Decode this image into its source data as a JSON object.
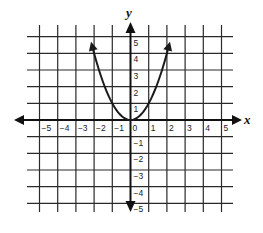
{
  "chart_data": {
    "type": "line",
    "title": "",
    "xlabel": "x",
    "ylabel": "y",
    "xlim": [
      -5,
      5
    ],
    "ylim": [
      -5,
      5
    ],
    "grid": true,
    "x_ticks": [
      -5,
      -4,
      -3,
      -2,
      -1,
      0,
      1,
      2,
      3,
      4,
      5
    ],
    "y_ticks": [
      5,
      4,
      3,
      2,
      1,
      -1,
      -2,
      -3,
      -4,
      -5
    ],
    "x_tick_labels": [
      "−5",
      "−4",
      "−3",
      "−2",
      "−1",
      "0",
      "1",
      "2",
      "3",
      "4",
      "5"
    ],
    "y_tick_labels": [
      "5",
      "4",
      "3",
      "2",
      "1",
      "−1",
      "−2",
      "−3",
      "−4",
      "−5"
    ],
    "series": [
      {
        "name": "y = x²",
        "equation": "y = x^2",
        "domain": [
          -2.1,
          2.1
        ],
        "arrows_at_ends": true,
        "x": [
          -2.1,
          -2,
          -1.5,
          -1,
          -0.5,
          0,
          0.5,
          1,
          1.5,
          2,
          2.1
        ],
        "values": [
          4.41,
          4,
          2.25,
          1,
          0.25,
          0,
          0.25,
          1,
          2.25,
          4,
          4.41
        ]
      }
    ]
  },
  "labels": {
    "x_axis": "x",
    "y_axis": "y"
  },
  "colors": {
    "grid": "#2a2a2a",
    "axis": "#111111",
    "curve": "#1a1a1a",
    "background": "#ffffff"
  }
}
